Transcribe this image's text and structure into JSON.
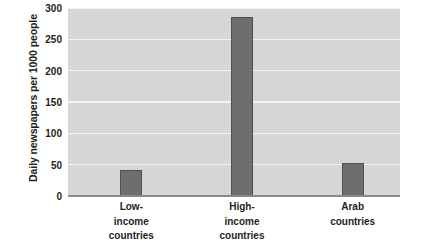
{
  "chart_data": {
    "type": "bar",
    "title": "",
    "xlabel": "",
    "ylabel": "Daily newspapers per 1000 people",
    "ylim": [
      0,
      300
    ],
    "yticks": [
      0,
      50,
      100,
      150,
      200,
      250,
      300
    ],
    "ytick_labels": [
      "0",
      "50",
      "100",
      "150",
      "200",
      "250",
      "300"
    ],
    "grid": true,
    "legend": false,
    "categories": [
      "Low-income countries",
      "High-income countries",
      "Arab countries"
    ],
    "category_lines": [
      [
        "Low-",
        "income",
        "countries"
      ],
      [
        "High-",
        "income",
        "countries"
      ],
      [
        "Arab",
        "countries"
      ]
    ],
    "values": [
      42,
      285,
      52
    ],
    "colors": {
      "bar_fill": "#6e6e6e",
      "bar_stroke": "#4f4f4f",
      "plot_background": "#d6d6d6",
      "gridline": "#f4f4f4",
      "axis_line": "#8a8a8a",
      "text": "#231f20",
      "page_background": "#ffffff"
    }
  }
}
